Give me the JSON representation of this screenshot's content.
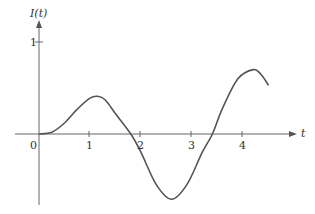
{
  "chart_data": {
    "type": "line",
    "title": "",
    "xlabel": "t",
    "ylabel": "I(t)",
    "origin_label": "0",
    "x_ticks": [
      "1",
      "2",
      "3",
      "4"
    ],
    "y_ticks": [
      "1"
    ],
    "xlim": [
      0,
      4.6
    ],
    "ylim": [
      -0.75,
      1.1
    ],
    "grid": false,
    "legend": null,
    "series": [
      {
        "name": "I(t)",
        "x": [
          0,
          0.25,
          0.5,
          0.75,
          1.0,
          1.15,
          1.3,
          1.5,
          1.8,
          2.0,
          2.3,
          2.6,
          2.9,
          3.2,
          3.4,
          3.6,
          3.9,
          4.2,
          4.35,
          4.5
        ],
        "values": [
          0,
          0.02,
          0.12,
          0.27,
          0.39,
          0.41,
          0.37,
          0.22,
          0.0,
          -0.2,
          -0.55,
          -0.71,
          -0.55,
          -0.2,
          0.0,
          0.28,
          0.6,
          0.7,
          0.65,
          0.53
        ]
      }
    ]
  }
}
